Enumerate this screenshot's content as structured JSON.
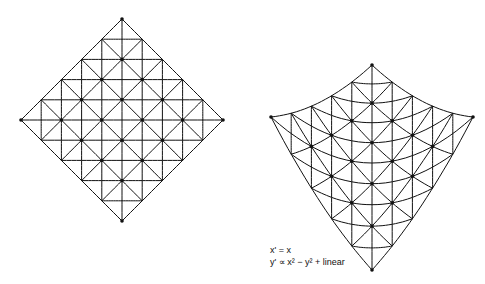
{
  "colors": {
    "line": "#111111",
    "background": "#ffffff"
  },
  "left_mesh": {
    "description": "original square mesh rotated 45 degrees",
    "vertices": {
      "top": [
        120,
        18
      ],
      "left": [
        21,
        122
      ],
      "right": [
        222,
        118
      ],
      "bottom": [
        124,
        220
      ]
    },
    "center": [
      122,
      120
    ],
    "half_width": 101,
    "half_height": 101,
    "grid_step": 0.2,
    "diagonal_offsets": [
      -1.0,
      -0.6,
      -0.2,
      0.2,
      0.6,
      1.0
    ]
  },
  "right_mesh": {
    "description": "transformed mesh",
    "center_x": 372,
    "half_width": 101,
    "y_c0": 163,
    "y_c1": -102.5,
    "y_v2": 4.5,
    "y_u2": -46
  },
  "caption": {
    "line1": "x' = x",
    "line2": "y' ∝ x² − y² + linear"
  }
}
